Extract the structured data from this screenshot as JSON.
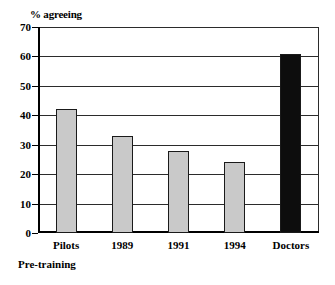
{
  "chart_data": {
    "type": "bar",
    "title": "",
    "ylabel": "% agreeing",
    "xlabel": "",
    "categories": [
      "Pilots",
      "1989",
      "1991",
      "1994",
      "Doctors"
    ],
    "values": [
      42,
      33,
      28,
      24,
      61
    ],
    "ylim": [
      0,
      70
    ],
    "ytick_labels": [
      "0",
      "10",
      "20",
      "30",
      "40",
      "50",
      "60",
      "70"
    ],
    "ytick_values": [
      0,
      10,
      20,
      30,
      40,
      50,
      60,
      70
    ],
    "grid": true,
    "legend": "none",
    "bar_colors": [
      "#c9c9c9",
      "#c9c9c9",
      "#c9c9c9",
      "#c9c9c9",
      "#0d0d0d"
    ],
    "bar_edge_color": "#1a1a1a",
    "annotations": [
      "Pre-training"
    ]
  },
  "footnote": "Pre-training",
  "axis_title": "% agreeing"
}
